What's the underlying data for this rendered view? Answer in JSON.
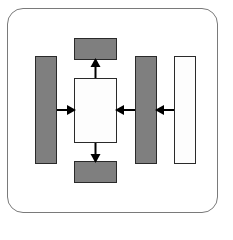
{
  "diagram": {
    "type": "block-flow",
    "colors": {
      "frame_border": "#7a7a7a",
      "gray_fill": "#7f7f7f",
      "white_fill": "#fdfdfd",
      "outline": "#2a2a2a",
      "arrow": "#000000"
    },
    "blocks": [
      {
        "id": "left-bar",
        "fill": "gray",
        "x": 35,
        "y": 56,
        "w": 22,
        "h": 108
      },
      {
        "id": "top-box",
        "fill": "gray",
        "x": 74,
        "y": 38,
        "w": 43,
        "h": 22
      },
      {
        "id": "center-box",
        "fill": "white",
        "x": 74,
        "y": 78,
        "w": 43,
        "h": 65
      },
      {
        "id": "bottom-box",
        "fill": "gray",
        "x": 74,
        "y": 161,
        "w": 43,
        "h": 22
      },
      {
        "id": "right-gray-bar",
        "fill": "gray",
        "x": 135,
        "y": 56,
        "w": 22,
        "h": 108
      },
      {
        "id": "right-white-bar",
        "fill": "white",
        "x": 174,
        "y": 56,
        "w": 22,
        "h": 108
      }
    ],
    "arrows": [
      {
        "from": "left-bar",
        "to": "center-box",
        "direction": "right"
      },
      {
        "from": "center-box",
        "to": "top-box",
        "direction": "up"
      },
      {
        "from": "center-box",
        "to": "bottom-box",
        "direction": "down"
      },
      {
        "from": "right-gray-bar",
        "to": "center-box",
        "direction": "left"
      },
      {
        "from": "right-white-bar",
        "to": "right-gray-bar",
        "direction": "left"
      }
    ]
  }
}
